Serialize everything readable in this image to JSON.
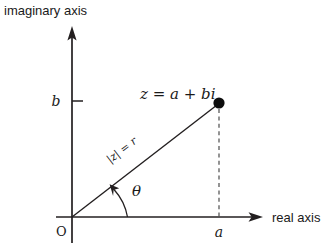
{
  "figure": {
    "type": "argand-diagram",
    "background_color": "#ffffff",
    "ink_color": "#231f20",
    "dash_color": "#4d4d4d"
  },
  "axes": {
    "vertical_label": "imaginary axis",
    "horizontal_label": "real axis",
    "origin_label": "O",
    "vertical_tick_label": "b",
    "horizontal_tick_label": "a"
  },
  "annotations": {
    "point_label": "z = a + bi",
    "modulus_label": "|z| = r",
    "angle_label": "θ"
  },
  "geometry": {
    "origin_x": 72,
    "origin_y": 217,
    "point_x": 219,
    "point_y": 104,
    "b_tick_y": 101,
    "y_axis_top": 28,
    "x_axis_right": 262
  }
}
